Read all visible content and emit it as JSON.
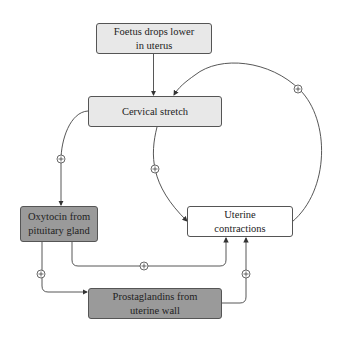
{
  "diagram": {
    "nodes": [
      {
        "id": "foetus",
        "label": "Foetus drops lower in uterus",
        "line1": "Foetus drops lower",
        "line2": "in uterus",
        "fill": "#e8e8e8"
      },
      {
        "id": "cervical",
        "label": "Cervical stretch",
        "fill": "#e8e8e8"
      },
      {
        "id": "oxytocin",
        "label": "Oxytocin from pituitary gland",
        "line1": "Oxytocin from",
        "line2": "pituitary gland",
        "fill": "#9a9a9a"
      },
      {
        "id": "uterine",
        "label": "Uterine contractions",
        "line1": "Uterine",
        "line2": "contractions",
        "fill": "#ffffff"
      },
      {
        "id": "prostaglandins",
        "label": "Prostaglandins from uterine wall",
        "line1": "Prostaglandins from",
        "line2": "uterine wall",
        "fill": "#9a9a9a"
      }
    ],
    "edges": [
      {
        "from": "foetus",
        "to": "cervical",
        "sign": ""
      },
      {
        "from": "cervical",
        "to": "oxytocin",
        "sign": "+"
      },
      {
        "from": "cervical",
        "to": "uterine",
        "sign": "+"
      },
      {
        "from": "uterine",
        "to": "cervical",
        "sign": "+"
      },
      {
        "from": "oxytocin",
        "to": "uterine",
        "sign": "+"
      },
      {
        "from": "oxytocin",
        "to": "prostaglandins",
        "sign": "+"
      },
      {
        "from": "prostaglandins",
        "to": "uterine",
        "sign": "+"
      }
    ],
    "plus_symbol": "+"
  }
}
